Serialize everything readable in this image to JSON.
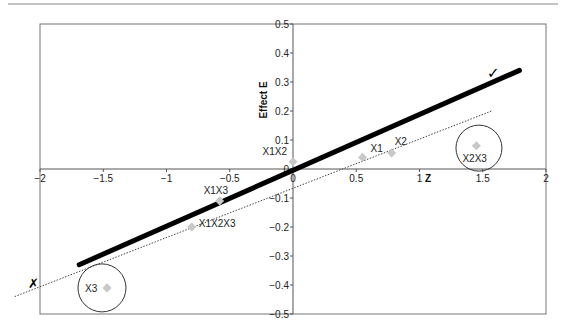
{
  "chart_data": {
    "type": "scatter",
    "title": "",
    "xlabel": "Z",
    "ylabel": "Effect E",
    "xlim": [
      -2,
      2
    ],
    "ylim": [
      -0.5,
      0.5
    ],
    "x_ticks": [
      -2,
      -1.5,
      -1,
      -0.5,
      0,
      0.5,
      1,
      1.5,
      2
    ],
    "x_tick_labels": [
      "-2",
      "-1.5",
      "-1",
      "-0.5",
      "0",
      "0.5",
      "1",
      "1.5",
      "2"
    ],
    "y_ticks": [
      0.5,
      0.4,
      0.3,
      0.2,
      0.1,
      0,
      -0.1,
      -0.2,
      -0.3,
      -0.4,
      -0.5
    ],
    "y_tick_labels": [
      "0.5",
      "0.4",
      "0.3",
      "0.2",
      "0.1",
      "0",
      "-0.1",
      "-0.2",
      "-0.3",
      "-0.4",
      "-0.5"
    ],
    "grid": false,
    "legend": null,
    "points": [
      {
        "label": "X1",
        "x": 0.55,
        "y": 0.04
      },
      {
        "label": "X2",
        "x": 0.78,
        "y": 0.055
      },
      {
        "label": "X1X2",
        "x": 0.0,
        "y": 0.025
      },
      {
        "label": "X1X3",
        "x": -0.58,
        "y": -0.11
      },
      {
        "label": "X1X2X3",
        "x": -0.8,
        "y": -0.2
      },
      {
        "label": "X2X3",
        "x": 1.45,
        "y": 0.08
      },
      {
        "label": "X3",
        "x": -1.47,
        "y": -0.41
      }
    ],
    "lines": [
      {
        "name": "fitted-line-correct",
        "style": "solid-thick",
        "x": [
          -1.69,
          1.79
        ],
        "y": [
          -0.33,
          0.34
        ],
        "annotation": "✓"
      },
      {
        "name": "fitted-line-incorrect",
        "style": "dotted",
        "x": [
          -2.2,
          1.57
        ],
        "y": [
          -0.44,
          0.2
        ],
        "annotation": "✗"
      }
    ],
    "outlier_circles": [
      {
        "label": "X2X3",
        "cx": 1.47,
        "cy": 0.072,
        "r_px": 23
      },
      {
        "label": "X3",
        "cx": -1.51,
        "cy": -0.41,
        "r_px": 24
      }
    ],
    "marker_color": "#c8c8c8"
  }
}
